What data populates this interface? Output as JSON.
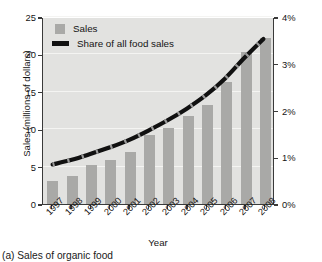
{
  "chart_data": {
    "type": "bar",
    "title": "",
    "xlabel": "Year",
    "ylabel": "Sales (millions of dollars)",
    "ylabel_secondary": "Percent share of all food sales",
    "categories": [
      "1997",
      "1998",
      "1999",
      "2000",
      "2001",
      "2002",
      "2003",
      "2004",
      "2005",
      "2006",
      "2007",
      "2008"
    ],
    "ylim": [
      0,
      25
    ],
    "ylim_secondary": [
      0,
      4
    ],
    "yticks": [
      "0",
      "5",
      "10",
      "15",
      "20",
      "25"
    ],
    "yticks_secondary": [
      "0%",
      "1%",
      "2%",
      "3%",
      "4%"
    ],
    "grid": true,
    "legend_position": "top-left",
    "series": [
      {
        "name": "Sales",
        "type": "bar",
        "axis": "left",
        "unit": "millions of dollars",
        "color": "#a9a9a7",
        "values": [
          3.1,
          3.8,
          5.2,
          5.9,
          7.0,
          9.2,
          10.1,
          11.7,
          13.2,
          16.3,
          20.3,
          22.2
        ]
      },
      {
        "name": "Share of all food sales",
        "type": "line",
        "axis": "right",
        "unit": "percent",
        "color": "#111111",
        "values": [
          0.85,
          0.95,
          1.08,
          1.22,
          1.38,
          1.58,
          1.8,
          2.05,
          2.34,
          2.7,
          3.14,
          3.55
        ]
      }
    ]
  },
  "legend": {
    "items": [
      {
        "label": "Sales"
      },
      {
        "label": "Share of all food sales"
      }
    ]
  },
  "axes": {
    "x_title": "Year",
    "y_left_title": "Sales (millions of dollars)",
    "y_right_title": "Percent share of all food sales"
  },
  "caption": {
    "text": "(a) Sales of organic food"
  }
}
